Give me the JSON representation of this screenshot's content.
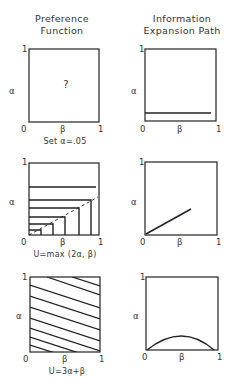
{
  "columns": {
    "left": {
      "title_line1": "Preference",
      "title_line2": "Function"
    },
    "right": {
      "title_line1": "Information",
      "title_line2": "Expansion Path"
    }
  },
  "axis": {
    "y_label": "α",
    "x_label": "β",
    "origin": "0",
    "one": "1"
  },
  "rows": [
    {
      "left": {
        "center_text": "?",
        "caption": "Set α=.05"
      },
      "right": {
        "description": "horizontal line at α=.05"
      }
    },
    {
      "left": {
        "caption": "U=max (2α, β)",
        "description": "nested L-shaped indifference curves with dashed diagonal α=β/2"
      },
      "right": {
        "description": "straight line from origin with slope 1/2"
      }
    },
    {
      "left": {
        "caption": "U=3α+β",
        "description": "parallel straight indifference lines with slope -1/3"
      },
      "right": {
        "description": "hump-shaped curve from (0,0) to (1,0)"
      }
    }
  ],
  "colors": {
    "ink": "#222222",
    "background": "#ffffff"
  }
}
